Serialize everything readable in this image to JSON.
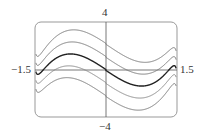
{
  "chart_data": {
    "type": "line",
    "title": "",
    "xlabel": "",
    "ylabel": "",
    "xlim": [
      -1.5,
      1.5
    ],
    "ylim": [
      -4,
      4
    ],
    "grid": false,
    "legend": null,
    "tick_labels": {
      "x_min": "−1.5",
      "x_max": "1.5",
      "y_max": "4",
      "y_min": "−4"
    },
    "series": [
      {
        "name": "curve-1",
        "offset": 2.2,
        "color": "#777777",
        "width": 1.0
      },
      {
        "name": "curve-2",
        "offset": 1.1,
        "color": "#777777",
        "width": 1.0
      },
      {
        "name": "curve-3",
        "offset": 0.0,
        "color": "#222222",
        "width": 1.4
      },
      {
        "name": "curve-4",
        "offset": -1.1,
        "color": "#888888",
        "width": 1.0
      },
      {
        "name": "curve-5",
        "offset": -2.2,
        "color": "#777777",
        "width": 1.0
      }
    ],
    "base_function": {
      "a": -2.6,
      "b": 1.6,
      "edge_gain": 0.06,
      "edge": 1.53
    },
    "sample_points_center_curve": {
      "x": [
        -1.45,
        -1.0,
        -0.75,
        0.0,
        0.75,
        1.0,
        1.45
      ],
      "y": [
        0.0,
        1.0,
        1.3,
        0.0,
        -1.3,
        -1.0,
        0.0
      ]
    }
  },
  "colors": {
    "frame": "#999999",
    "axis": "#555555"
  }
}
